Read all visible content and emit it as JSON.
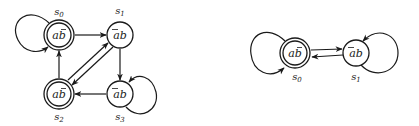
{
  "diagrams": [
    {
      "id": "left",
      "nodes": [
        {
          "name": "s",
          "sub": "0",
          "label_a": "a",
          "label_b": "b",
          "bar_on": "b",
          "accepting": true
        },
        {
          "name": "s",
          "sub": "1",
          "label_a": "a",
          "label_b": "b",
          "bar_on": "a",
          "accepting": false
        },
        {
          "name": "s",
          "sub": "2",
          "label_a": "a",
          "label_b": "b",
          "bar_on": "b",
          "accepting": true
        },
        {
          "name": "s",
          "sub": "3",
          "label_a": "a",
          "label_b": "b",
          "bar_on": "a",
          "accepting": false
        }
      ],
      "edges": [
        {
          "from": "s0",
          "to": "s0",
          "type": "self-loop"
        },
        {
          "from": "s0",
          "to": "s1"
        },
        {
          "from": "s1",
          "to": "s3"
        },
        {
          "from": "s1",
          "to": "s2"
        },
        {
          "from": "s2",
          "to": "s1"
        },
        {
          "from": "s2",
          "to": "s0"
        },
        {
          "from": "s3",
          "to": "s2"
        },
        {
          "from": "s3",
          "to": "s3",
          "type": "self-loop"
        }
      ]
    },
    {
      "id": "right",
      "nodes": [
        {
          "name": "s",
          "sub": "0",
          "label_a": "a",
          "label_b": "b",
          "bar_on": "b",
          "accepting": true
        },
        {
          "name": "s",
          "sub": "1",
          "label_a": "a",
          "label_b": "b",
          "bar_on": "a",
          "accepting": false
        }
      ],
      "edges": [
        {
          "from": "s0",
          "to": "s0",
          "type": "self-loop"
        },
        {
          "from": "s0",
          "to": "s1"
        },
        {
          "from": "s1",
          "to": "s0"
        },
        {
          "from": "s1",
          "to": "s1",
          "type": "self-loop"
        }
      ]
    }
  ]
}
